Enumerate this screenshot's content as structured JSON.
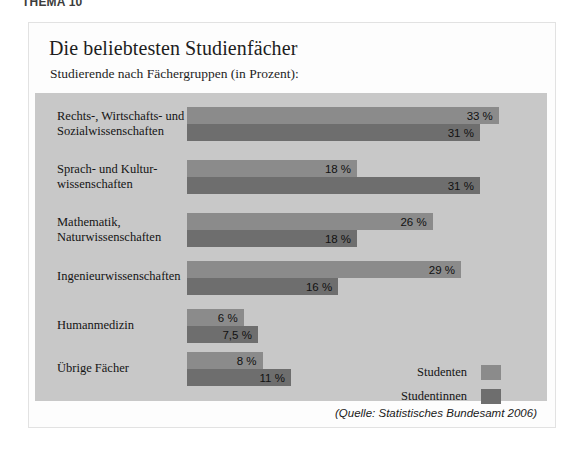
{
  "page": {
    "header_fragment": "THEMA 10"
  },
  "figure": {
    "title": "Die beliebtesten Studienfächer",
    "subtitle": "Studierende nach Fächergruppen (in Prozent):",
    "source": "(Quelle: Statistisches Bundesamt 2006)"
  },
  "legend": {
    "items": [
      {
        "label": "Studenten",
        "color": "#8b8b8b"
      },
      {
        "label": "Studentinnen",
        "color": "#6e6e6e"
      }
    ]
  },
  "chart_data": {
    "type": "bar",
    "orientation": "horizontal",
    "title": "Die beliebtesten Studienfächer",
    "subtitle": "Studierende nach Fächergruppen (in Prozent):",
    "xlabel": "",
    "ylabel": "",
    "xlim": [
      0,
      33
    ],
    "unit": "%",
    "grid": false,
    "legend_position": "bottom-right",
    "source": "(Quelle: Statistisches Bundesamt 2006)",
    "categories": [
      "Rechts-, Wirtschafts- und Sozialwissenschaften",
      "Sprach- und Kulturwissenschaften",
      "Mathematik, Naturwissenschaften",
      "Ingenieurwissenschaften",
      "Humanmedizin",
      "Übrige Fächer"
    ],
    "category_lines": [
      [
        "Rechts-, Wirtschafts- und",
        "Sozialwissenschaften"
      ],
      [
        "Sprach- und Kultur-",
        "wissenschaften"
      ],
      [
        "Mathematik,",
        "Naturwissenschaften"
      ],
      [
        "Ingenieurwissenschaften"
      ],
      [
        "Humanmedizin"
      ],
      [
        "Übrige Fächer"
      ]
    ],
    "series": [
      {
        "name": "Studenten",
        "color": "#8b8b8b",
        "values": [
          33,
          18,
          26,
          29,
          6,
          8
        ],
        "labels": [
          "33 %",
          "18 %",
          "26 %",
          "29 %",
          "6 %",
          "8 %"
        ]
      },
      {
        "name": "Studentinnen",
        "color": "#6e6e6e",
        "values": [
          31,
          31,
          18,
          16,
          7.5,
          11
        ],
        "labels": [
          "31 %",
          "31 %",
          "18 %",
          "16 %",
          "7,5 %",
          "11 %"
        ]
      }
    ]
  }
}
